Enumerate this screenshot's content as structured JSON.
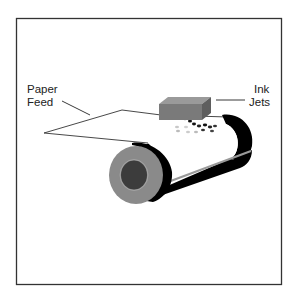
{
  "diagram": {
    "labels": {
      "paper_feed_line1": "Paper",
      "paper_feed_line2": "Feed",
      "ink_jets_line1": "Ink",
      "ink_jets_line2": "Jets"
    },
    "colors": {
      "frame": "#333333",
      "roller_band": "#000000",
      "roller_face": "#8a8a8a",
      "roller_core": "#3c3c3c",
      "print_head": "#7a7a7a",
      "ink_drop_dark": "#111111",
      "ink_drop_light": "#c8c8c8"
    }
  }
}
